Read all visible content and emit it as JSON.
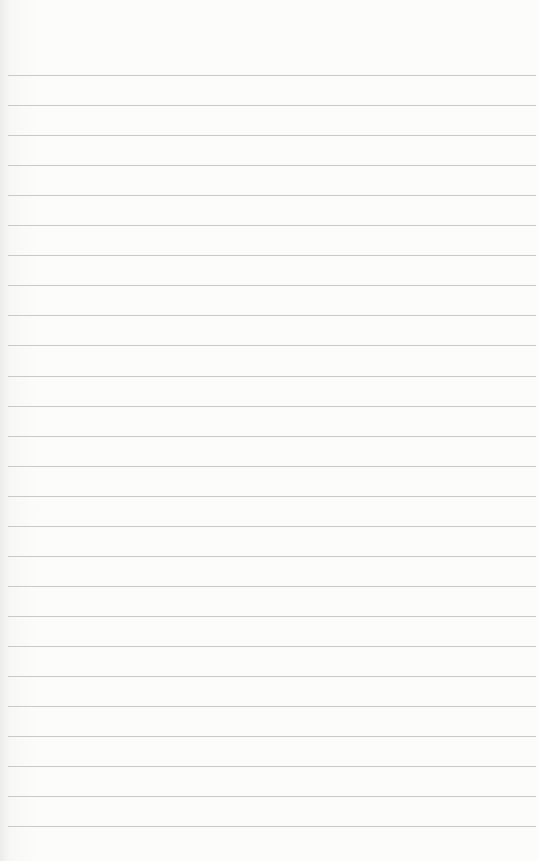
{
  "page": {
    "type": "lined-notepad-page",
    "rule_count": 26,
    "rule_color": "#c9c9c7",
    "paper_color": "#fbfbfa",
    "text": ""
  }
}
